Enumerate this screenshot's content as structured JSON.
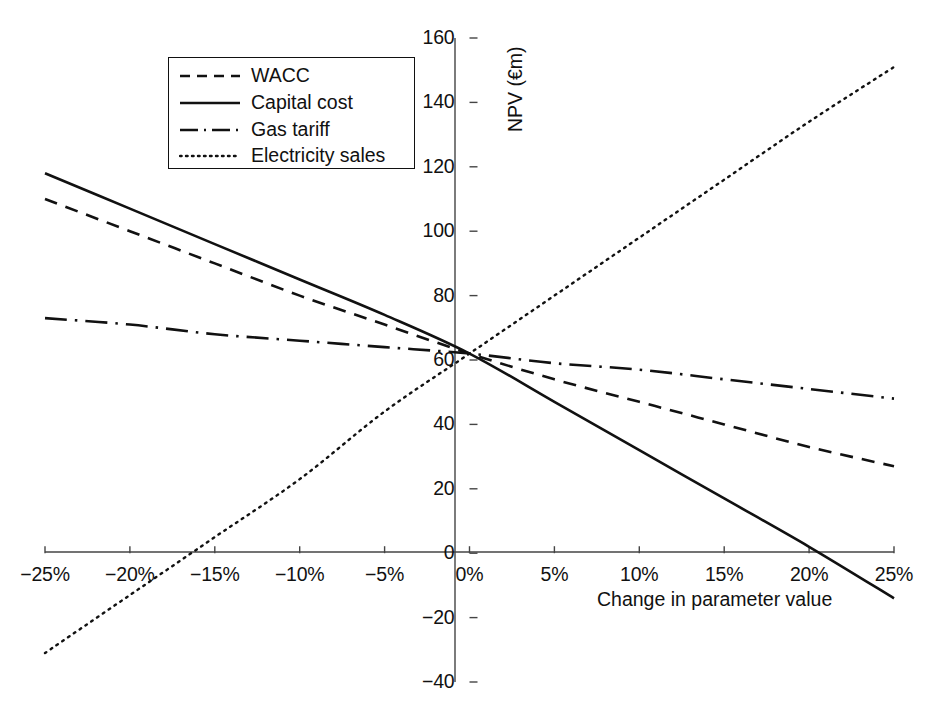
{
  "chart_data": {
    "type": "line",
    "title": "",
    "xlabel": "Change in parameter value",
    "ylabel": "NPV (€m)",
    "xlim": [
      -25,
      25
    ],
    "ylim": [
      -40,
      160
    ],
    "grid": false,
    "legend_position": "top-left",
    "x_tick_labels": [
      "−25%",
      "−20%",
      "−15%",
      "−10%",
      "−5%",
      "0%",
      "5%",
      "10%",
      "15%",
      "20%",
      "25%"
    ],
    "x_ticks": [
      -25,
      -20,
      -15,
      -10,
      -5,
      0,
      5,
      10,
      15,
      20,
      25
    ],
    "y_tick_labels": [
      "−40",
      "−20",
      "0",
      "20",
      "40",
      "60",
      "80",
      "100",
      "120",
      "140",
      "160"
    ],
    "y_ticks": [
      -40,
      -20,
      0,
      20,
      40,
      60,
      80,
      100,
      120,
      140,
      160
    ],
    "x": [
      -25,
      -20,
      -15,
      -10,
      -5,
      0,
      5,
      10,
      15,
      20,
      25
    ],
    "series": [
      {
        "name": "WACC",
        "style": "dashed",
        "values": [
          110,
          100,
          90,
          80,
          71,
          62,
          54,
          47,
          40,
          33,
          27
        ]
      },
      {
        "name": "Capital cost",
        "style": "solid",
        "values": [
          118,
          107,
          96,
          85,
          74,
          62,
          47,
          32,
          17,
          2,
          -14
        ]
      },
      {
        "name": "Gas tariff",
        "style": "dash-dot",
        "values": [
          73,
          71,
          68,
          66,
          64,
          62,
          59,
          57,
          54,
          51,
          48
        ]
      },
      {
        "name": "Electricity sales",
        "style": "dotted",
        "values": [
          -31,
          -13,
          5,
          23,
          44,
          62,
          80,
          98,
          116,
          134,
          151
        ]
      }
    ]
  },
  "legend": {
    "items": [
      {
        "label": "WACC",
        "style": "dashed"
      },
      {
        "label": "Capital cost",
        "style": "solid"
      },
      {
        "label": "Gas tariff",
        "style": "dash-dot"
      },
      {
        "label": "Electricity sales",
        "style": "dotted"
      }
    ]
  },
  "axes": {
    "x_axis_title": "Change in parameter value",
    "y_axis_title": "NPV (€m)"
  }
}
